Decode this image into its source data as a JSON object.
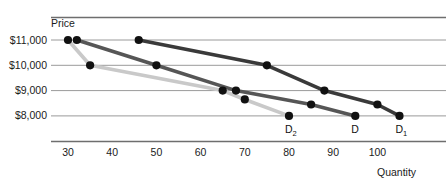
{
  "chart_data": {
    "type": "line",
    "title": "",
    "xlabel": "Quantity",
    "ylabel": "Price",
    "xlim": [
      22,
      112
    ],
    "ylim": [
      7600,
      11450
    ],
    "grid": true,
    "legend": "inline-endpoint-labels",
    "xticks": [
      30,
      40,
      50,
      60,
      70,
      80,
      90,
      100
    ],
    "xtick_labels": [
      "30",
      "40",
      "50",
      "60",
      "70",
      "80",
      "90",
      "100"
    ],
    "yticks": [
      8000,
      9000,
      10000,
      11000
    ],
    "ytick_labels": [
      "$8,000",
      "$9,000",
      "$10,000",
      "$11,000"
    ],
    "series": [
      {
        "name": "D2",
        "label": "D",
        "label_sub": "2",
        "color": "#c9c9c9",
        "x": [
          30,
          35,
          65,
          70,
          80
        ],
        "y": [
          11000,
          10000,
          9000,
          8650,
          8000
        ],
        "markers_x": [
          30,
          35,
          65,
          70,
          80
        ],
        "markers_y": [
          11000,
          10000,
          9000,
          8650,
          8000
        ]
      },
      {
        "name": "D",
        "label": "D",
        "label_sub": "",
        "color": "#565656",
        "x": [
          32,
          50,
          68,
          85,
          95
        ],
        "y": [
          11000,
          10000,
          9000,
          8450,
          8000
        ],
        "markers_x": [
          32,
          50,
          68,
          85,
          95
        ],
        "markers_y": [
          11000,
          10000,
          9000,
          8450,
          8000
        ]
      },
      {
        "name": "D1",
        "label": "D",
        "label_sub": "1",
        "color": "#3a3a3a",
        "x": [
          46,
          75,
          88,
          100,
          105
        ],
        "y": [
          11000,
          10000,
          9000,
          8450,
          8000
        ],
        "markers_x": [
          46,
          75,
          88,
          100,
          105
        ],
        "markers_y": [
          11000,
          10000,
          9000,
          8450,
          8000
        ]
      }
    ],
    "endpoint_labels": [
      {
        "text": "D",
        "sub": "2",
        "x": 80,
        "y": 8000
      },
      {
        "text": "D",
        "sub": "",
        "x": 95,
        "y": 8000
      },
      {
        "text": "D",
        "sub": "1",
        "x": 105,
        "y": 8000
      }
    ],
    "colors": {
      "gridline": "#9a9a9a",
      "axis": "#6e6e6e",
      "marker": "#111111",
      "text": "#1b1b1b",
      "background": "#ffffff"
    }
  }
}
